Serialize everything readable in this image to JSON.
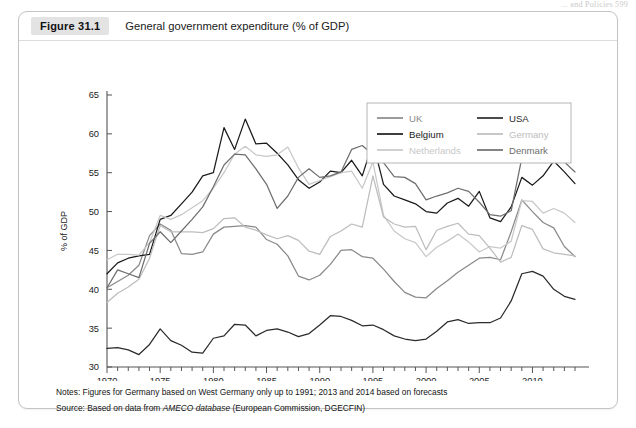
{
  "running_head": "... and Policies  599",
  "figure": {
    "tag": "Figure 31.1",
    "title": "General government expenditure (% of GDP)"
  },
  "notes": {
    "notes_label": "Notes:",
    "notes_text": "Figures for Germany based on West Germany only up to 1991; 2013 and 2014 based on forecasts",
    "source_label": "Source:",
    "source_pre": "Based on data from ",
    "source_italic": "AMECO database",
    "source_post": " (European Commission, DGECFIN)"
  },
  "colors": {
    "uk": "#8a8a8a",
    "belgium": "#1a1a1a",
    "netherlands": "#c8c8c8",
    "usa": "#2b2b2b",
    "germany": "#bdbdbd",
    "denmark": "#6e6e6e",
    "axis": "#555555",
    "frame": "#c4c4c4",
    "tag_bg": "#e3e3e3"
  },
  "chart_data": {
    "type": "line",
    "title": "General government expenditure (% of GDP)",
    "xlabel": "",
    "ylabel": "% of GDP",
    "ylim": [
      30,
      65
    ],
    "xlim": [
      1970,
      2014
    ],
    "yticks": [
      30,
      35,
      40,
      45,
      50,
      55,
      60,
      65
    ],
    "xticks": [
      1970,
      1975,
      1980,
      1985,
      1990,
      1995,
      2000,
      2005,
      2010
    ],
    "xtick_minor_step": 1,
    "grid": false,
    "legend_position": "top-right-inside",
    "x": [
      1970,
      1971,
      1972,
      1973,
      1974,
      1975,
      1976,
      1977,
      1978,
      1979,
      1980,
      1981,
      1982,
      1983,
      1984,
      1985,
      1986,
      1987,
      1988,
      1989,
      1990,
      1991,
      1992,
      1993,
      1994,
      1995,
      1996,
      1997,
      1998,
      1999,
      2000,
      2001,
      2002,
      2003,
      2004,
      2005,
      2006,
      2007,
      2008,
      2009,
      2010,
      2011,
      2012,
      2013,
      2014
    ],
    "series": [
      {
        "name": "UK",
        "color": "#8a8a8a",
        "values": [
          40.2,
          41.0,
          41.8,
          43.1,
          46.9,
          48.4,
          47.6,
          44.6,
          44.5,
          44.8,
          47.1,
          48.0,
          48.1,
          48.2,
          48.0,
          46.4,
          45.8,
          44.3,
          41.7,
          41.2,
          41.8,
          43.2,
          45.0,
          45.1,
          44.2,
          44.0,
          42.6,
          41.0,
          39.6,
          39.0,
          38.9,
          40.1,
          41.1,
          42.2,
          43.1,
          44.0,
          44.1,
          43.8,
          47.4,
          51.5,
          50.0,
          48.6,
          47.9,
          45.5,
          44.2
        ]
      },
      {
        "name": "Belgium",
        "color": "#1a1a1a",
        "values": [
          42.0,
          43.4,
          44.0,
          44.3,
          44.5,
          49.0,
          49.5,
          51.0,
          52.5,
          54.6,
          55.0,
          60.8,
          58.0,
          61.9,
          58.7,
          58.8,
          57.5,
          56.0,
          54.1,
          53.0,
          53.8,
          55.2,
          55.0,
          56.6,
          54.6,
          58.9,
          53.5,
          52.0,
          51.5,
          51.0,
          50.0,
          49.8,
          51.1,
          51.7,
          50.7,
          52.6,
          49.2,
          48.7,
          50.6,
          54.4,
          53.4,
          54.6,
          56.5,
          55.1,
          53.6
        ]
      },
      {
        "name": "Netherlands",
        "color": "#c8c8c8",
        "values": [
          43.8,
          44.5,
          44.5,
          44.4,
          46.0,
          49.5,
          49.0,
          49.6,
          50.5,
          51.4,
          53.0,
          55.0,
          57.4,
          58.4,
          57.3,
          57.1,
          57.3,
          58.3,
          55.6,
          53.5,
          54.0,
          54.5,
          55.0,
          55.2,
          53.0,
          56.4,
          49.5,
          47.5,
          46.5,
          46.0,
          44.2,
          45.4,
          46.2,
          47.1,
          46.1,
          44.8,
          45.5,
          45.3,
          46.2,
          51.4,
          51.3,
          49.8,
          50.4,
          49.8,
          48.6
        ]
      },
      {
        "name": "USA",
        "color": "#2b2b2b",
        "values": [
          32.4,
          32.5,
          32.2,
          31.6,
          32.9,
          34.9,
          33.4,
          32.8,
          31.9,
          31.8,
          33.7,
          34.0,
          35.5,
          35.4,
          34.0,
          34.7,
          34.9,
          34.5,
          33.9,
          34.3,
          35.4,
          36.6,
          36.5,
          36.0,
          35.3,
          35.4,
          34.8,
          34.0,
          33.6,
          33.4,
          33.6,
          34.6,
          35.8,
          36.1,
          35.6,
          35.7,
          35.7,
          36.3,
          38.5,
          42.0,
          42.3,
          41.7,
          40.0,
          39.1,
          38.7
        ]
      },
      {
        "name": "Germany",
        "color": "#bdbdbd",
        "values": [
          38.3,
          39.5,
          40.3,
          41.3,
          44.0,
          48.2,
          47.4,
          47.4,
          47.4,
          47.3,
          47.8,
          49.1,
          49.2,
          48.0,
          47.6,
          47.0,
          46.5,
          46.9,
          46.3,
          44.9,
          44.5,
          46.8,
          47.5,
          48.4,
          48.0,
          54.6,
          49.3,
          48.4,
          48.0,
          48.1,
          45.1,
          47.6,
          48.1,
          48.5,
          47.1,
          46.9,
          45.3,
          43.5,
          44.1,
          48.2,
          47.7,
          45.2,
          44.7,
          44.5,
          44.3
        ]
      },
      {
        "name": "Denmark",
        "color": "#6e6e6e",
        "values": [
          40.2,
          42.5,
          42.0,
          41.5,
          45.9,
          47.4,
          46.0,
          47.5,
          49.0,
          50.6,
          53.2,
          56.0,
          57.4,
          57.3,
          55.5,
          53.5,
          50.4,
          52.0,
          54.4,
          55.5,
          54.4,
          54.6,
          55.1,
          58.0,
          58.5,
          57.3,
          56.3,
          54.5,
          54.4,
          53.6,
          51.5,
          52.0,
          52.4,
          53.0,
          52.6,
          51.2,
          49.6,
          49.4,
          50.1,
          56.9,
          56.7,
          56.4,
          58.0,
          56.4,
          55.1
        ]
      }
    ],
    "legend": [
      {
        "name": "UK",
        "color": "#8a8a8a"
      },
      {
        "name": "Belgium",
        "color": "#1a1a1a"
      },
      {
        "name": "Netherlands",
        "color": "#c8c8c8"
      },
      {
        "name": "USA",
        "color": "#2b2b2b"
      },
      {
        "name": "Germany",
        "color": "#bdbdbd"
      },
      {
        "name": "Denmark",
        "color": "#6e6e6e"
      }
    ]
  }
}
